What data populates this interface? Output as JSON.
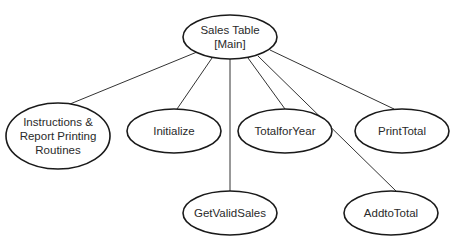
{
  "diagram": {
    "type": "hierarchy-chart",
    "root": {
      "id": "sales-table",
      "lines": [
        "Sales Table",
        "[Main]"
      ],
      "cx": 230,
      "cy": 37,
      "rx": 47,
      "ry": 22
    },
    "children": [
      {
        "id": "instructions",
        "lines": [
          "Instructions &",
          "Report Printing",
          "Routines"
        ],
        "cx": 58,
        "cy": 136,
        "rx": 52,
        "ry": 33,
        "edge_from": [
          197,
          52
        ],
        "edge_to": [
          70,
          104
        ]
      },
      {
        "id": "initialize",
        "lines": [
          "Initialize"
        ],
        "cx": 174,
        "cy": 131,
        "rx": 47,
        "ry": 22,
        "edge_from": [
          212,
          58
        ],
        "edge_to": [
          177,
          109
        ]
      },
      {
        "id": "get-valid-sales",
        "lines": [
          "GetValidSales"
        ],
        "cx": 230,
        "cy": 213,
        "rx": 47,
        "ry": 22,
        "edge_from": [
          230,
          59
        ],
        "edge_to": [
          230,
          191
        ]
      },
      {
        "id": "total-for-year",
        "lines": [
          "TotalforYear"
        ],
        "cx": 285,
        "cy": 131,
        "rx": 47,
        "ry": 22,
        "edge_from": [
          248,
          58
        ],
        "edge_to": [
          285,
          109
        ]
      },
      {
        "id": "add-to-total",
        "lines": [
          "AddtoTotal"
        ],
        "cx": 391,
        "cy": 213,
        "rx": 47,
        "ry": 22,
        "edge_from": [
          258,
          56
        ],
        "edge_to": [
          396,
          191
        ]
      },
      {
        "id": "print-total",
        "lines": [
          "PrintTotal"
        ],
        "cx": 402,
        "cy": 131,
        "rx": 47,
        "ry": 22,
        "edge_from": [
          270,
          50
        ],
        "edge_to": [
          394,
          109
        ]
      }
    ]
  }
}
